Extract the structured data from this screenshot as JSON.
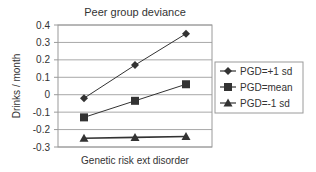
{
  "chart_data": {
    "type": "line",
    "title": "Peer group deviance",
    "xlabel": "Genetic risk ext disorder",
    "ylabel": "Drinks / month",
    "categories": [
      "Low",
      "Mean",
      "High"
    ],
    "ylim": [
      -0.3,
      0.4
    ],
    "yticks": [
      0.4,
      0.3,
      0.2,
      0.1,
      0,
      -0.1,
      -0.2,
      -0.3
    ],
    "ytick_labels": [
      "0.4",
      "0.3",
      "0.2",
      "0.1",
      "0",
      "-0.1",
      "-0.2",
      "-0.3"
    ],
    "grid": true,
    "legend_position": "right",
    "series": [
      {
        "name": "PGD=+1 sd",
        "marker": "diamond",
        "values": [
          -0.02,
          0.17,
          0.35
        ]
      },
      {
        "name": "PGD=mean",
        "marker": "square",
        "values": [
          -0.13,
          -0.035,
          0.06
        ]
      },
      {
        "name": "PGD=-1 sd",
        "marker": "triangle",
        "values": [
          -0.25,
          -0.245,
          -0.24
        ]
      }
    ]
  },
  "colors": {
    "line": "#333333",
    "grid": "#a8a8a8",
    "frame": "#9a9a9a"
  }
}
